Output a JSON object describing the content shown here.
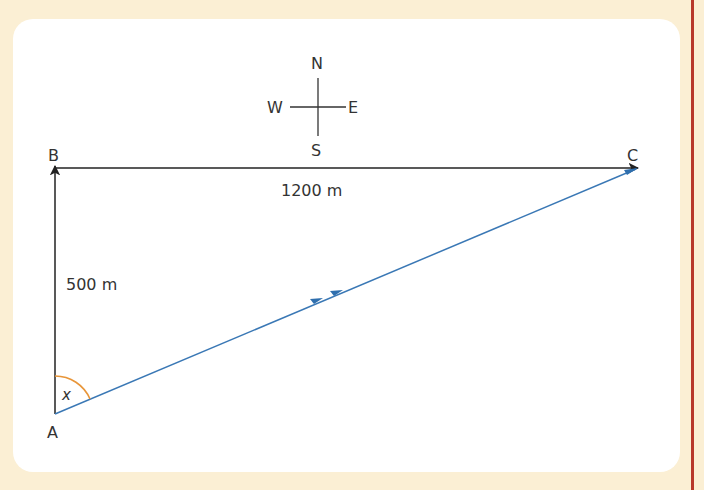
{
  "compass": {
    "north": "N",
    "south": "S",
    "east": "E",
    "west": "W"
  },
  "points": {
    "a": "A",
    "b": "B",
    "c": "C"
  },
  "lengths": {
    "ab": "500 m",
    "bc": "1200 m"
  },
  "angle": {
    "label": "x"
  },
  "colors": {
    "background": "#fbefd4",
    "card": "#ffffff",
    "rule": "#b8392b",
    "path_ac": "#3a78b5",
    "angle_arc": "#e8963a",
    "lines": "#222222"
  }
}
